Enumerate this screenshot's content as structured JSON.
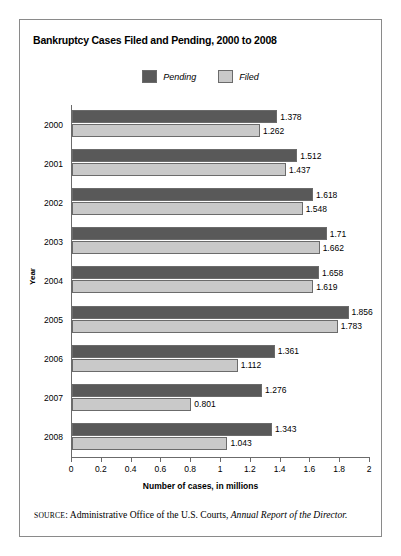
{
  "chart_data": {
    "type": "bar",
    "orientation": "horizontal",
    "title": "Bankruptcy Cases Filed and Pending, 2000 to 2008",
    "xlabel": "Number of cases, in millions",
    "ylabel": "Year",
    "xlim": [
      0,
      2
    ],
    "xticks": [
      "0",
      "0.2",
      "0.4",
      "0.6",
      "0.8",
      "1",
      "1.2",
      "1.4",
      "1.6",
      "1.8",
      "2"
    ],
    "xtick_values": [
      0,
      0.2,
      0.4,
      0.6,
      0.8,
      1,
      1.2,
      1.4,
      1.6,
      1.8,
      2
    ],
    "grid": false,
    "legend_position": "top-center",
    "categories": [
      "2000",
      "2001",
      "2002",
      "2003",
      "2004",
      "2005",
      "2006",
      "2007",
      "2008"
    ],
    "series": [
      {
        "name": "Pending",
        "color": "#595959",
        "values": [
          1.378,
          1.512,
          1.618,
          1.71,
          1.658,
          1.856,
          1.361,
          1.276,
          1.343
        ],
        "labels": [
          "1.378",
          "1.512",
          "1.618",
          "1.71",
          "1.658",
          "1.856",
          "1.361",
          "1.276",
          "1.343"
        ]
      },
      {
        "name": "Filed",
        "color": "#c9c9c9",
        "values": [
          1.262,
          1.437,
          1.548,
          1.662,
          1.619,
          1.783,
          1.112,
          0.801,
          1.043
        ],
        "labels": [
          "1.262",
          "1.437",
          "1.548",
          "1.662",
          "1.619",
          "1.783",
          "1.112",
          "0.801",
          "1.043"
        ]
      }
    ]
  },
  "legend": [
    {
      "label": "Pending",
      "color": "#595959"
    },
    {
      "label": "Filed",
      "color": "#c9c9c9"
    }
  ],
  "source": {
    "label": "SOURCE",
    "separator": ": ",
    "text": "Administrative Office of the U.S. Courts, ",
    "italic_text": "Annual Report of the Director."
  }
}
